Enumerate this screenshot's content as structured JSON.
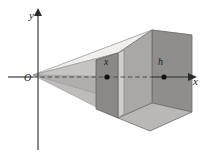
{
  "figure": {
    "kind": "3d-solid-cross-section-diagram",
    "background": "#ffffff"
  },
  "axes": {
    "y_label": "y",
    "x_label": "x",
    "origin_label": "O",
    "x_axis_arrow": "arrow-right",
    "y_axis_arrow": "arrow-up",
    "axis_color": "#2b2b2b",
    "hidden_axis_style": "dashed"
  },
  "annotations": [
    {
      "name": "cross-section-position",
      "label": "x",
      "marker": "filled-dot"
    },
    {
      "name": "solid-depth",
      "label": "h",
      "marker": "filled-dot"
    }
  ],
  "colors": {
    "top_face": "#f0efee",
    "near_face": "#b0afae",
    "front_right_face": "#a9a8a7",
    "right_end_face": "#8f8e8d",
    "bottom_face": "#b9b8b7",
    "cross_section_face": "#8a8988",
    "cross_section_side": "#c9c8c7",
    "outline": "#6e6d6c",
    "axis": "#2b2b2b",
    "dot": "#111111"
  }
}
